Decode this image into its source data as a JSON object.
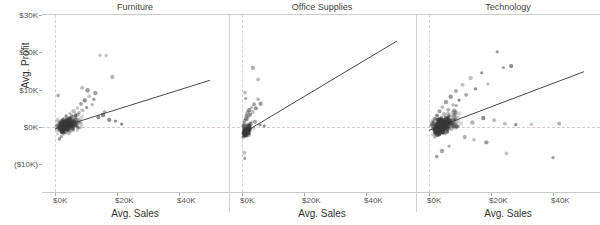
{
  "chart_data": {
    "type": "scatter",
    "title": "",
    "xlabel": "Avg. Sales",
    "ylabel": "Avg. Profit",
    "xlim": [
      -5000,
      52000
    ],
    "ylim": [
      -14000,
      32000
    ],
    "grid": false,
    "legend": "none",
    "facet_layout": "columns",
    "facets": [
      {
        "label": "Furniture",
        "xticks": [
          "$0K",
          "$20K",
          "$40K"
        ],
        "xtickvalues": [
          0,
          20000,
          40000
        ],
        "trendline": {
          "x0": 0,
          "y0": -500,
          "x1": 50000,
          "y1": 12500
        },
        "n_points": 380,
        "cluster_center": [
          2200,
          600
        ],
        "points": [
          [
            600,
            300
          ],
          [
            900,
            450
          ],
          [
            1200,
            -200
          ],
          [
            1500,
            900
          ],
          [
            1800,
            1400
          ],
          [
            2100,
            200
          ],
          [
            2400,
            1800
          ],
          [
            2700,
            -600
          ],
          [
            3000,
            2400
          ],
          [
            3300,
            1100
          ],
          [
            3600,
            3000
          ],
          [
            4200,
            2100
          ],
          [
            4800,
            3600
          ],
          [
            5400,
            2800
          ],
          [
            6000,
            4200
          ],
          [
            6600,
            3100
          ],
          [
            7200,
            5100
          ],
          [
            7800,
            3900
          ],
          [
            8400,
            6200
          ],
          [
            9000,
            4400
          ],
          [
            9600,
            7100
          ],
          [
            10200,
            5200
          ],
          [
            11000,
            8200
          ],
          [
            12000,
            6000
          ],
          [
            13000,
            9100
          ],
          [
            14500,
            19200
          ],
          [
            16500,
            19100
          ],
          [
            18500,
            13400
          ],
          [
            8800,
            10500
          ],
          [
            10500,
            9800
          ],
          [
            12500,
            7400
          ],
          [
            15500,
            3200
          ],
          [
            17500,
            1900
          ],
          [
            19500,
            1600
          ],
          [
            21500,
            800
          ],
          [
            14000,
            2600
          ],
          [
            16000,
            4100
          ],
          [
            1000,
            8400
          ],
          [
            1400,
            -3200
          ],
          [
            2000,
            -2600
          ],
          [
            2600,
            -1900
          ]
        ]
      },
      {
        "label": "Office Supplies",
        "xticks": [
          "$0K",
          "$20K",
          "$40K"
        ],
        "xtickvalues": [
          0,
          20000,
          40000
        ],
        "trendline": {
          "x0": 0,
          "y0": -1800,
          "x1": 50000,
          "y1": 23000
        },
        "n_points": 190,
        "cluster_center": [
          800,
          300
        ],
        "points": [
          [
            300,
            200
          ],
          [
            450,
            600
          ],
          [
            600,
            -300
          ],
          [
            750,
            1100
          ],
          [
            900,
            1700
          ],
          [
            1050,
            400
          ],
          [
            1200,
            2300
          ],
          [
            1400,
            3100
          ],
          [
            1600,
            2000
          ],
          [
            1800,
            3800
          ],
          [
            2000,
            2700
          ],
          [
            2300,
            4500
          ],
          [
            2600,
            3300
          ],
          [
            3000,
            5200
          ],
          [
            3400,
            4000
          ],
          [
            3900,
            6100
          ],
          [
            4500,
            5000
          ],
          [
            5200,
            7400
          ],
          [
            6000,
            6200
          ],
          [
            3500,
            15800
          ],
          [
            5200,
            12700
          ],
          [
            1000,
            9200
          ],
          [
            1200,
            7600
          ],
          [
            800,
            -6900
          ],
          [
            900,
            -8400
          ],
          [
            2800,
            900
          ],
          [
            4200,
            1400
          ],
          [
            5800,
            600
          ],
          [
            7200,
            300
          ]
        ]
      },
      {
        "label": "Technology",
        "xticks": [
          "$0K",
          "$20K",
          "$40K"
        ],
        "xtickvalues": [
          0,
          20000,
          40000
        ],
        "trendline": {
          "x0": 0,
          "y0": -900,
          "x1": 50000,
          "y1": 14800
        },
        "n_points": 430,
        "cluster_center": [
          2600,
          700
        ],
        "points": [
          [
            700,
            400
          ],
          [
            1000,
            900
          ],
          [
            1300,
            -400
          ],
          [
            1600,
            1500
          ],
          [
            1900,
            2300
          ],
          [
            2200,
            600
          ],
          [
            2600,
            3100
          ],
          [
            3000,
            -900
          ],
          [
            3400,
            4200
          ],
          [
            3800,
            2000
          ],
          [
            4300,
            5300
          ],
          [
            4900,
            3400
          ],
          [
            5500,
            6700
          ],
          [
            6200,
            4600
          ],
          [
            7000,
            8100
          ],
          [
            7800,
            5900
          ],
          [
            8700,
            9600
          ],
          [
            9700,
            7200
          ],
          [
            10800,
            11300
          ],
          [
            12000,
            8600
          ],
          [
            13400,
            13100
          ],
          [
            15000,
            10200
          ],
          [
            17000,
            14500
          ],
          [
            19000,
            11500
          ],
          [
            22000,
            20100
          ],
          [
            24000,
            15900
          ],
          [
            26500,
            16300
          ],
          [
            14000,
            1200
          ],
          [
            17500,
            2400
          ],
          [
            21000,
            1800
          ],
          [
            24500,
            900
          ],
          [
            28000,
            600
          ],
          [
            33000,
            700
          ],
          [
            42000,
            900
          ],
          [
            11500,
            -2700
          ],
          [
            14500,
            -3400
          ],
          [
            18500,
            -4100
          ],
          [
            25000,
            -7100
          ],
          [
            40000,
            -8200
          ],
          [
            6500,
            -5100
          ],
          [
            4200,
            -6400
          ],
          [
            2500,
            -7900
          ]
        ]
      }
    ]
  },
  "axes": {
    "yticks": [
      {
        "label": "$30K",
        "value": 30000
      },
      {
        "label": "$20K",
        "value": 20000
      },
      {
        "label": "$10K",
        "value": 10000
      },
      {
        "label": "$0K",
        "value": 0
      },
      {
        "label": "($10K)",
        "value": -10000
      }
    ]
  }
}
